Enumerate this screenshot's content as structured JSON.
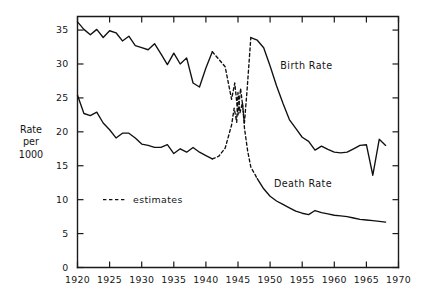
{
  "chart_data": {
    "type": "line",
    "title": "",
    "subtitle": "",
    "xlabel": "",
    "ylabel": "Rate per 1000",
    "ylabel_lines": [
      "Rate",
      "per",
      "1000"
    ],
    "xlim": [
      1920,
      1970
    ],
    "ylim": [
      0,
      37
    ],
    "grid": false,
    "legend_position": "inside-left",
    "x_ticks": [
      1920,
      1925,
      1930,
      1935,
      1940,
      1945,
      1950,
      1955,
      1960,
      1965,
      1970
    ],
    "x_tick_labels": [
      "1920",
      "1925",
      "1930",
      "1935",
      "1940",
      "1945",
      "1950",
      "1955",
      "1960",
      "1965",
      "1970"
    ],
    "y_ticks": [
      0,
      5,
      10,
      15,
      20,
      25,
      30,
      35
    ],
    "y_tick_labels": [
      "0",
      "5",
      "10",
      "15",
      "20",
      "25",
      "30",
      "35"
    ],
    "legend": [
      {
        "label": "estimates",
        "style": "dashed"
      }
    ],
    "annotations": [
      {
        "text": "Birth Rate",
        "x": 1951.6,
        "y": 29.8
      },
      {
        "text": "Death Rate",
        "x": 1950.6,
        "y": 12.4
      }
    ],
    "series": [
      {
        "name": "Birth Rate",
        "style": "solid",
        "color": "#101010",
        "segments": [
          {
            "style": "solid",
            "x": [
              1920,
              1921,
              1922,
              1923,
              1924,
              1925,
              1926,
              1927,
              1928,
              1929,
              1930,
              1931,
              1932,
              1933,
              1934,
              1935,
              1936,
              1937,
              1938,
              1939,
              1940,
              1941
            ],
            "y": [
              36.2,
              35.1,
              34.3,
              35.1,
              33.9,
              34.9,
              34.6,
              33.4,
              34.1,
              32.7,
              32.4,
              32.1,
              33.0,
              31.5,
              29.9,
              31.6,
              30.0,
              30.9,
              27.2,
              26.6,
              29.4,
              31.8
            ]
          },
          {
            "style": "dashed",
            "x": [
              1941,
              1942,
              1943,
              1944,
              1944.5,
              1945,
              1945.4,
              1945.7,
              1946,
              1946.4,
              1947
            ],
            "y": [
              31.8,
              30.7,
              29.6,
              24.8,
              27.2,
              22.5,
              26.4,
              24.1,
              21.3,
              26.0,
              33.9
            ]
          },
          {
            "style": "solid",
            "x": [
              1947,
              1948,
              1949,
              1950,
              1951,
              1952,
              1953,
              1954,
              1955,
              1956,
              1957,
              1958,
              1959,
              1960,
              1961,
              1962,
              1963,
              1964,
              1965,
              1966,
              1967,
              1968
            ],
            "y": [
              33.9,
              33.5,
              32.4,
              29.7,
              26.8,
              24.2,
              21.8,
              20.5,
              19.2,
              18.6,
              17.3,
              17.9,
              17.4,
              17.0,
              16.9,
              17.0,
              17.5,
              18.0,
              18.1,
              13.6,
              18.9,
              18.0
            ]
          }
        ]
      },
      {
        "name": "Death Rate",
        "style": "solid",
        "color": "#101010",
        "segments": [
          {
            "style": "solid",
            "x": [
              1920,
              1921,
              1922,
              1923,
              1924,
              1925,
              1926,
              1927,
              1928,
              1929,
              1930,
              1931,
              1932,
              1933,
              1934,
              1935,
              1936,
              1937,
              1938,
              1939,
              1940,
              1941
            ],
            "y": [
              25.4,
              22.7,
              22.4,
              22.9,
              21.3,
              20.3,
              19.1,
              19.8,
              19.8,
              19.1,
              18.2,
              18.0,
              17.7,
              17.7,
              18.1,
              16.8,
              17.5,
              17.0,
              17.7,
              17.0,
              16.5,
              16.0
            ]
          },
          {
            "style": "dashed",
            "x": [
              1941,
              1942,
              1943,
              1944,
              1944.4,
              1944.8,
              1945,
              1945.3,
              1945.7,
              1946,
              1946.5,
              1947,
              1948
            ],
            "y": [
              16.0,
              16.4,
              17.6,
              21.0,
              23.5,
              21.4,
              25.8,
              22.8,
              24.3,
              20.6,
              17.2,
              14.8,
              13.1
            ]
          },
          {
            "style": "solid",
            "x": [
              1948,
              1949,
              1950,
              1951,
              1952,
              1953,
              1954,
              1955,
              1956,
              1957,
              1958,
              1959,
              1960,
              1961,
              1962,
              1963,
              1964,
              1965,
              1966,
              1967,
              1968
            ],
            "y": [
              13.1,
              11.6,
              10.5,
              9.8,
              9.3,
              8.8,
              8.3,
              8.0,
              7.8,
              8.4,
              8.1,
              7.9,
              7.7,
              7.6,
              7.5,
              7.3,
              7.1,
              7.0,
              6.9,
              6.8,
              6.7
            ]
          }
        ]
      }
    ]
  }
}
